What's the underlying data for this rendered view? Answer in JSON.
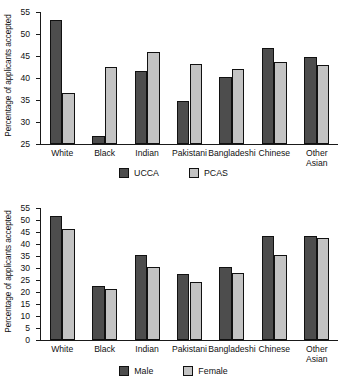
{
  "charts": [
    {
      "name": "acceptance-by-ethnicity-scheme",
      "ylabel": "Percentage of applicants accepted",
      "categories": [
        "White",
        "Black",
        "Indian",
        "Pakistani",
        "Bangladeshi",
        "Chinese",
        "Other Asian"
      ],
      "yticks": [
        25,
        30,
        35,
        40,
        45,
        50,
        55
      ],
      "legend": [
        "UCCA",
        "PCAS"
      ]
    },
    {
      "name": "acceptance-by-ethnicity-gender",
      "ylabel": "Percentage of applicants accepted",
      "categories": [
        "White",
        "Black",
        "Indian",
        "Pakistani",
        "Bangladeshi",
        "Chinese",
        "Other Asian"
      ],
      "yticks": [
        0,
        5,
        10,
        15,
        20,
        25,
        30,
        35,
        40,
        45,
        50,
        55
      ],
      "legend": [
        "Male",
        "Female"
      ]
    }
  ],
  "chart_data": [
    {
      "type": "bar",
      "title": "",
      "xlabel": "",
      "ylabel": "Percentage of applicants accepted",
      "categories": [
        "White",
        "Black",
        "Indian",
        "Pakistani",
        "Bangladeshi",
        "Chinese",
        "Other Asian"
      ],
      "series": [
        {
          "name": "UCCA",
          "color": "#4d4d4d",
          "values": [
            53.2,
            26.8,
            41.7,
            34.8,
            40.3,
            46.8,
            44.7
          ]
        },
        {
          "name": "PCAS",
          "color": "#c3c3c3",
          "values": [
            36.7,
            42.4,
            45.8,
            43.2,
            42.0,
            43.7,
            43.0
          ]
        }
      ],
      "ylim": [
        25,
        55
      ],
      "yticks": [
        25,
        30,
        35,
        40,
        45,
        50,
        55
      ],
      "grid": false,
      "legend_position": "bottom"
    },
    {
      "type": "bar",
      "title": "",
      "xlabel": "",
      "ylabel": "Percentage of applicants accepted",
      "categories": [
        "White",
        "Black",
        "Indian",
        "Pakistani",
        "Bangladeshi",
        "Chinese",
        "Other Asian"
      ],
      "series": [
        {
          "name": "Male",
          "color": "#4d4d4d",
          "values": [
            51.5,
            22.4,
            35.6,
            27.3,
            30.3,
            43.2,
            43.2
          ]
        },
        {
          "name": "Female",
          "color": "#c3c3c3",
          "values": [
            46.4,
            21.3,
            30.4,
            24.2,
            28.0,
            35.4,
            42.6
          ]
        }
      ],
      "ylim": [
        0,
        55
      ],
      "yticks": [
        0,
        5,
        10,
        15,
        20,
        25,
        30,
        35,
        40,
        45,
        50,
        55
      ],
      "grid": false,
      "legend_position": "bottom"
    }
  ]
}
